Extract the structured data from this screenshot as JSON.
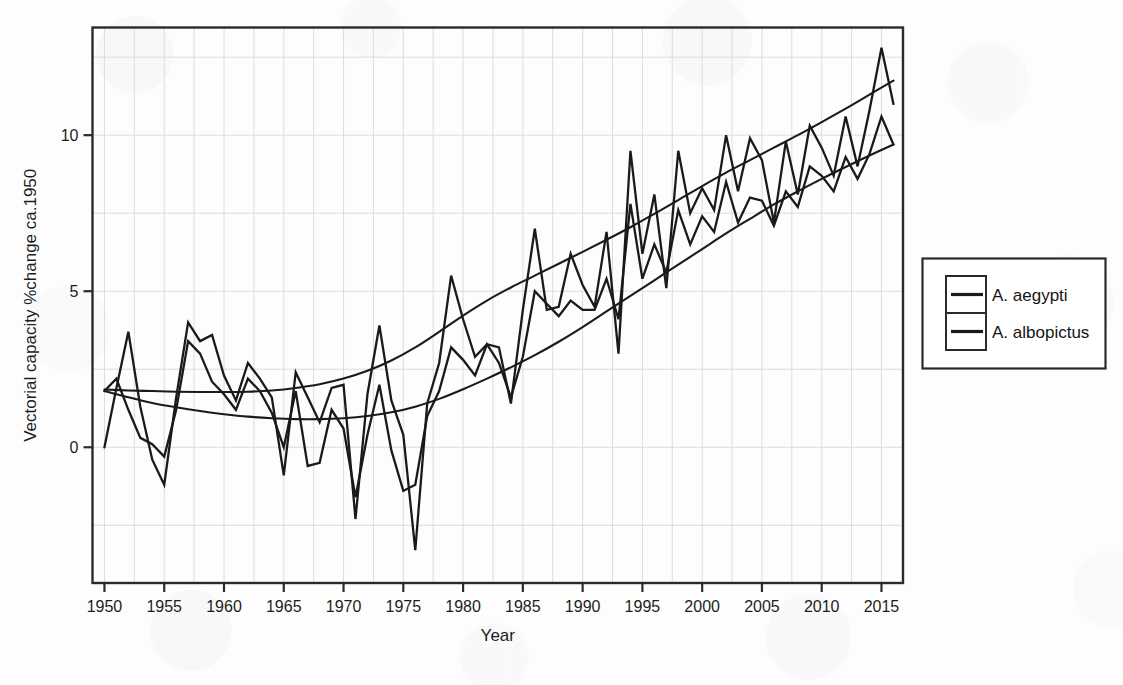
{
  "chart_data": {
    "type": "line",
    "title": "",
    "xlabel": "Year",
    "ylabel": "Vectorial capacity %change  ca.1950",
    "xlim": [
      1949.0,
      2016.8
    ],
    "ylim": [
      -4.35,
      13.45
    ],
    "xticks": [
      1950,
      1955,
      1960,
      1965,
      1970,
      1975,
      1980,
      1985,
      1990,
      1995,
      2000,
      2005,
      2010,
      2015
    ],
    "xtick_labels": [
      "1950",
      "1955",
      "1960",
      "1965",
      "1970",
      "1975",
      "1980",
      "1985",
      "1990",
      "1995",
      "2000",
      "2005",
      "2010",
      "2015"
    ],
    "yticks": [
      0,
      5,
      10
    ],
    "ytick_labels": [
      "0",
      "5",
      "10"
    ],
    "grid": true,
    "grid_x_step": 2.5,
    "grid_y_step": 2.5,
    "legend_position": "right-outside",
    "line_color": "#1a1a1a",
    "grid_color": "#dcdcdc",
    "axis_color": "#2b2b2b",
    "x": [
      1950,
      1951,
      1952,
      1953,
      1954,
      1955,
      1956,
      1957,
      1958,
      1959,
      1960,
      1961,
      1962,
      1963,
      1964,
      1965,
      1966,
      1967,
      1968,
      1969,
      1970,
      1971,
      1972,
      1973,
      1974,
      1975,
      1976,
      1977,
      1978,
      1979,
      1980,
      1981,
      1982,
      1983,
      1984,
      1985,
      1986,
      1987,
      1988,
      1989,
      1990,
      1991,
      1992,
      1993,
      1994,
      1995,
      1996,
      1997,
      1998,
      1999,
      2000,
      2001,
      2002,
      2003,
      2004,
      2005,
      2006,
      2007,
      2008,
      2009,
      2010,
      2011,
      2012,
      2013,
      2014,
      2015,
      2016
    ],
    "series": [
      {
        "name": "A. aegypti",
        "legend_label": "A. aegypti",
        "values": [
          0.0,
          1.9,
          3.7,
          1.3,
          -0.4,
          -1.2,
          1.6,
          4.0,
          3.4,
          3.6,
          2.3,
          1.5,
          2.7,
          2.2,
          1.6,
          -0.9,
          2.4,
          1.6,
          0.8,
          1.9,
          2.0,
          -2.3,
          1.7,
          3.9,
          1.5,
          0.4,
          -3.3,
          1.4,
          2.7,
          5.5,
          4.1,
          2.9,
          3.3,
          3.2,
          1.4,
          4.4,
          7.0,
          4.4,
          4.5,
          6.2,
          5.2,
          4.5,
          6.9,
          3.0,
          9.5,
          6.2,
          8.1,
          5.1,
          9.5,
          7.5,
          8.3,
          7.6,
          10.0,
          8.2,
          9.9,
          9.2,
          7.2,
          9.8,
          8.1,
          10.3,
          9.6,
          8.7,
          10.6,
          9.0,
          10.8,
          12.8,
          11.0
        ]
      },
      {
        "name": "A. albopictus",
        "legend_label": "A. albopictus",
        "values": [
          1.8,
          2.2,
          1.2,
          0.3,
          0.1,
          -0.3,
          1.2,
          3.4,
          3.0,
          2.1,
          1.7,
          1.2,
          2.2,
          1.8,
          1.1,
          0.0,
          1.8,
          -0.6,
          -0.5,
          1.2,
          0.6,
          -1.6,
          0.4,
          2.0,
          -0.1,
          -1.4,
          -1.2,
          1.0,
          1.8,
          3.2,
          2.8,
          2.3,
          3.3,
          2.7,
          1.6,
          2.9,
          5.0,
          4.6,
          4.2,
          4.7,
          4.4,
          4.4,
          5.4,
          4.1,
          7.8,
          5.4,
          6.5,
          5.6,
          7.6,
          6.5,
          7.4,
          6.9,
          8.5,
          7.2,
          8.0,
          7.9,
          7.1,
          8.2,
          7.7,
          9.0,
          8.7,
          8.2,
          9.3,
          8.6,
          9.4,
          10.6,
          9.7
        ]
      }
    ],
    "trend_curves": [
      {
        "name": "A. aegypti-trend",
        "x": [
          1950,
          1952,
          1954,
          1956,
          1958,
          1960,
          1962,
          1964,
          1966,
          1968,
          1970,
          1972,
          1974,
          1976,
          1978,
          1980,
          1982,
          1984,
          1986,
          1988,
          1990,
          1992,
          1994,
          1996,
          1998,
          2000,
          2002,
          2004,
          2006,
          2008,
          2010,
          2012,
          2014,
          2016
        ],
        "values": [
          1.85,
          1.82,
          1.8,
          1.78,
          1.77,
          1.77,
          1.78,
          1.82,
          1.9,
          2.02,
          2.2,
          2.45,
          2.78,
          3.2,
          3.7,
          4.22,
          4.7,
          5.12,
          5.5,
          5.88,
          6.26,
          6.65,
          7.05,
          7.48,
          7.92,
          8.37,
          8.8,
          9.2,
          9.6,
          10.0,
          10.42,
          10.85,
          11.3,
          11.75
        ]
      },
      {
        "name": "A. albopictus-trend",
        "x": [
          1950,
          1952,
          1954,
          1956,
          1958,
          1960,
          1962,
          1964,
          1966,
          1968,
          1970,
          1972,
          1974,
          1976,
          1978,
          1980,
          1982,
          1984,
          1986,
          1988,
          1990,
          1992,
          1994,
          1996,
          1998,
          2000,
          2002,
          2004,
          2006,
          2008,
          2010,
          2012,
          2014,
          2016
        ],
        "values": [
          1.8,
          1.6,
          1.42,
          1.28,
          1.16,
          1.06,
          0.98,
          0.93,
          0.9,
          0.9,
          0.93,
          1.0,
          1.12,
          1.3,
          1.55,
          1.86,
          2.2,
          2.56,
          2.95,
          3.38,
          3.85,
          4.35,
          4.85,
          5.35,
          5.85,
          6.35,
          6.85,
          7.32,
          7.78,
          8.2,
          8.6,
          8.98,
          9.35,
          9.7
        ]
      }
    ]
  },
  "legend": {
    "entries": [
      {
        "label": "A. aegypti"
      },
      {
        "label": "A. albopictus"
      }
    ]
  },
  "axes": {
    "x_title": "Year",
    "y_title": "Vectorial capacity %change  ca.1950"
  }
}
